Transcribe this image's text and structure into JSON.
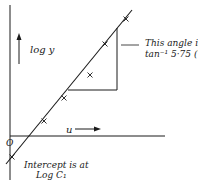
{
  "diagram": {
    "y_axis_label": "log y",
    "x_axis_label": "u",
    "origin_label": "O",
    "angle_annotation": {
      "line1": "This angle is",
      "line2": "tan⁻¹ 5·75 (T/ρ)½"
    },
    "intercept_annotation": {
      "line1": "Intercept is at",
      "line2": "Log C₁"
    },
    "colors": {
      "ink": "#1a1a1a",
      "background": "#ffffff"
    },
    "data_points": [
      {
        "x": 12,
        "y": 157
      },
      {
        "x": 44,
        "y": 121
      },
      {
        "x": 64,
        "y": 98
      },
      {
        "x": 90,
        "y": 75
      },
      {
        "x": 105,
        "y": 44
      },
      {
        "x": 126,
        "y": 19
      }
    ]
  }
}
